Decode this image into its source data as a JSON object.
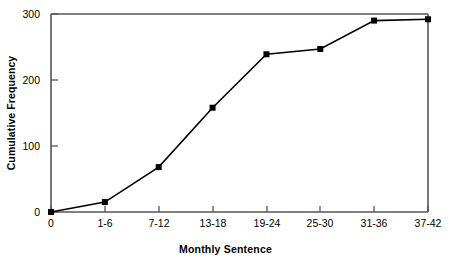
{
  "chart_data": {
    "type": "line",
    "title": "",
    "xlabel": "Monthly Sentence",
    "ylabel": "Cumulative Frequency",
    "categories": [
      "0",
      "1-6",
      "7-12",
      "13-18",
      "19-24",
      "25-30",
      "31-36",
      "37-42"
    ],
    "values": [
      0,
      15,
      68,
      158,
      239,
      247,
      290,
      292
    ],
    "ytick_labels": [
      "0",
      "100",
      "200",
      "300"
    ],
    "yticks": [
      0,
      100,
      200,
      300
    ],
    "ylim": [
      0,
      300
    ],
    "grid": false,
    "legend": false,
    "marker": "square",
    "line_color": "#000000",
    "marker_color": "#000000",
    "axis_color": "#555555",
    "background": "#ffffff"
  },
  "axes": {
    "x_title": "Monthly Sentence",
    "y_title": "Cumulative Frequency",
    "x_tick_labels": [
      "0",
      "1-6",
      "7-12",
      "13-18",
      "19-24",
      "25-30",
      "31-36",
      "37-42"
    ],
    "y_tick_labels": [
      "300",
      "200",
      "100",
      "0"
    ]
  }
}
